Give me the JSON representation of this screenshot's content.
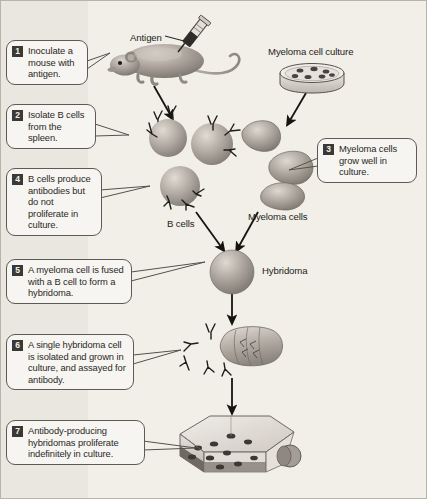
{
  "figure": {
    "background_color": "#f2efe9",
    "ink_color": "#2a2926"
  },
  "steps": [
    {
      "number": "1",
      "text": "Inoculate a mouse with antigen."
    },
    {
      "number": "2",
      "text": "Isolate B cells from the spleen."
    },
    {
      "number": "3",
      "text": "Myeloma cells grow well in culture."
    },
    {
      "number": "4",
      "text": "B cells produce antibodies but do not proliferate in culture."
    },
    {
      "number": "5",
      "text": "A myeloma cell is fused with a B cell to form a hybridoma."
    },
    {
      "number": "6",
      "text": "A single hybridoma cell is isolated and grown in culture, and assayed for antibody."
    },
    {
      "number": "7",
      "text": "Antibody-producing hybridomas proliferate indefinitely in culture."
    }
  ],
  "labels": {
    "antigen": "Antigen",
    "myeloma_cell_culture": "Myeloma cell culture",
    "b_cells": "B cells",
    "myeloma_cells": "Myeloma cells",
    "hybridoma": "Hybridoma"
  },
  "illustrations": [
    {
      "name": "mouse-with-syringe",
      "caption": "Antigen"
    },
    {
      "name": "petri-dish",
      "caption": "Myeloma cell culture"
    },
    {
      "name": "b-cell-group",
      "caption": "B cells"
    },
    {
      "name": "myeloma-cell-group",
      "caption": "Myeloma cells"
    },
    {
      "name": "hybridoma-cell",
      "caption": "Hybridoma"
    },
    {
      "name": "hybridoma-with-antibodies",
      "caption": ""
    },
    {
      "name": "culture-flask",
      "caption": ""
    }
  ]
}
